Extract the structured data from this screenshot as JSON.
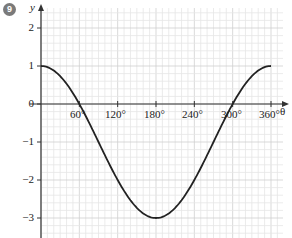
{
  "question_number": "9",
  "chart_data": {
    "type": "line",
    "title": "",
    "xlabel": "θ",
    "ylabel": "y",
    "xlim": [
      0,
      380
    ],
    "ylim": [
      -3.3,
      2.5
    ],
    "x_ticks": [
      60,
      120,
      180,
      240,
      300,
      360
    ],
    "x_tick_labels": [
      "60°",
      "120°",
      "180°",
      "240°",
      "300°",
      "360°"
    ],
    "y_ticks": [
      2,
      1,
      0,
      -1,
      -2,
      -3
    ],
    "y_tick_labels": [
      "2",
      "1",
      "0",
      "−1",
      "−2",
      "−3"
    ],
    "grid": true,
    "series": [
      {
        "name": "y = 2cos θ − 1",
        "x": [
          0,
          30,
          60,
          90,
          120,
          150,
          180,
          210,
          240,
          270,
          300,
          330,
          360
        ],
        "y": [
          1,
          0.73,
          0,
          -1,
          -2,
          -2.73,
          -3,
          -2.73,
          -2,
          -1,
          0,
          0.73,
          1
        ]
      }
    ],
    "colors": {
      "curve": "#222222",
      "axis": "#333333",
      "grid_minor": "#e6e6e6",
      "grid_major": "#cfcfcf"
    }
  },
  "labels": {
    "y_axis": "y",
    "x_axis": "θ",
    "x60": "60°",
    "x120": "120°",
    "x180": "180°",
    "x240": "240°",
    "x300": "300°",
    "x360": "360°",
    "y2": "2",
    "y1": "1",
    "y0": "0",
    "ym1": "−1",
    "ym2": "−2",
    "ym3": "−3"
  }
}
